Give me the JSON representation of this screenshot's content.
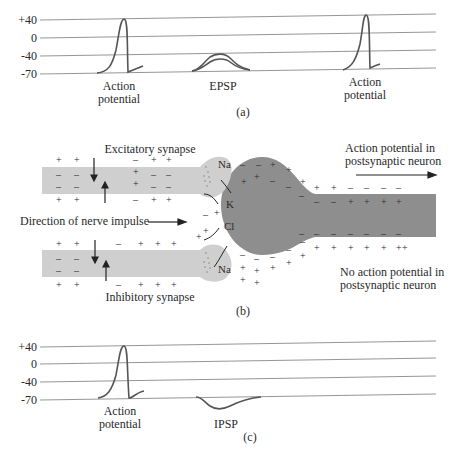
{
  "panel_a": {
    "caption": "(a)",
    "y_ticks": [
      "+40",
      "0",
      "-40",
      "-70"
    ],
    "labels": {
      "ap1_line1": "Action",
      "ap1_line2": "potential",
      "epsp": "EPSP",
      "ap2_line1": "Action",
      "ap2_line2": "potential"
    }
  },
  "panel_b": {
    "caption": "(b)",
    "excitatory_label": "Excitatory synapse",
    "inhibitory_label": "Inhibitory synapse",
    "direction_label": "Direction of nerve impulse",
    "ap_in_post_line1": "Action potential in",
    "ap_in_post_line2": "postsynaptic neuron",
    "no_ap_line1": "No action potential in",
    "no_ap_line2": "postsynaptic neuron",
    "ions": {
      "na_top": "Na",
      "k": "K",
      "cl": "Cl",
      "na_bottom": "Na"
    },
    "colors": {
      "axon_fill": "#cfcfcf",
      "soma_fill": "#8e8e8e"
    }
  },
  "panel_c": {
    "caption": "(c)",
    "y_ticks": [
      "+40",
      "0",
      "-40",
      "-70"
    ],
    "labels": {
      "ap_line1": "Action",
      "ap_line2": "potential",
      "ipsp": "IPSP"
    }
  }
}
